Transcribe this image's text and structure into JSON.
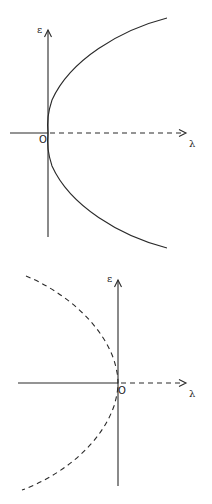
{
  "diagrams": [
    {
      "id": "top",
      "y_axis_label": "ε",
      "x_axis_label": "λ",
      "origin_label": "O",
      "curve_style": "solid",
      "curve_opens": "right",
      "negative_x_axis_style": "solid",
      "positive_x_axis_style": "dashed"
    },
    {
      "id": "bottom",
      "y_axis_label": "ε",
      "x_axis_label": "λ",
      "origin_label": "O",
      "curve_style": "dashed",
      "curve_opens": "left",
      "negative_x_axis_style": "solid",
      "positive_x_axis_style": "dashed"
    }
  ],
  "colors": {
    "line": "#2a2a2a",
    "background": "#ffffff"
  }
}
